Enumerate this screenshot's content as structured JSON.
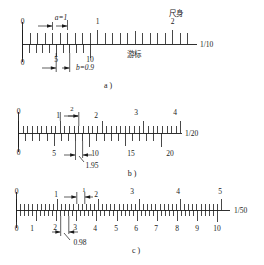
{
  "figure": {
    "title_text_present": false,
    "panels": [
      {
        "id": "a",
        "caption": "a )",
        "ratio_label": "1/10",
        "main_scale_name": "尺身",
        "vernier_name": "游标",
        "dimension_top": "a=1",
        "dimension_bottom": "b=0.9",
        "top_ticks": [
          "0",
          "1",
          "2"
        ],
        "bottom_ticks": [
          "0",
          "5",
          "10"
        ]
      },
      {
        "id": "b",
        "caption": "b )",
        "ratio_label": "1/20",
        "dimension_top": "2",
        "dimension_bottom": "1.95",
        "top_ticks": [
          "0",
          "1",
          "2",
          "3",
          "4"
        ],
        "bottom_ticks": [
          "0",
          "5",
          "10",
          "15",
          "20"
        ]
      },
      {
        "id": "c",
        "caption": "c )",
        "ratio_label": "1/50",
        "dimension_top": "1",
        "dimension_bottom": "0.98",
        "top_ticks": [
          "0",
          "1",
          "2",
          "3",
          "4",
          "5"
        ],
        "bottom_ticks": [
          "0",
          "1",
          "2",
          "3",
          "4",
          "5",
          "6",
          "7",
          "8",
          "9",
          "10"
        ]
      }
    ],
    "colors": {
      "ink": "#1a1a1a",
      "paper": "#ffffff"
    }
  }
}
